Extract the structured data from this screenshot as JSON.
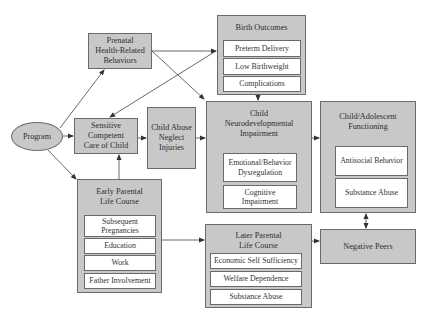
{
  "diagram": {
    "program": "Program",
    "prenatal": {
      "title": "Prenatal Health-Related Behaviors",
      "lines": [
        "Prenatal",
        "Health-Related",
        "Behaviors"
      ]
    },
    "birth_outcomes": {
      "title": "Birth Outcomes",
      "items": [
        "Preterm Delivery",
        "Low Birthweight",
        "Complications"
      ]
    },
    "sensitive_care": {
      "title": "Sensitive Competent Care of Child",
      "lines": [
        "Sensitive",
        "Competent",
        "Care of Child"
      ]
    },
    "child_abuse": {
      "title": "Child Abuse Neglect Injuries",
      "lines": [
        "Child Abuse",
        "Neglect",
        "Injuries"
      ]
    },
    "neuro": {
      "title": "Child Neurodevelopmental Impairment",
      "lines": [
        "Child",
        "Neurodevelopmental",
        "Impairment"
      ],
      "items": [
        "Emotional/Behavior Dysregulation",
        "Cognitive Impairment"
      ]
    },
    "child_adolescent": {
      "title": "Child/Adolescent Functioning",
      "lines": [
        "Child/Adolescent",
        "Functioning"
      ],
      "items": [
        "Antisocial Behavior",
        "Substance Abuse"
      ]
    },
    "early_parental": {
      "title": "Early Parental Life Course",
      "lines": [
        "Early Parental",
        "Life Course"
      ],
      "items": [
        "Subsequent Pregnancies",
        "Education",
        "Work",
        "Father Involvement"
      ]
    },
    "later_parental": {
      "title": "Later Parental Life Course",
      "lines": [
        "Later Parental",
        "Life Course"
      ],
      "items": [
        "Economic Self Sufficiency",
        "Welfare Dependence",
        "Substance Abuse"
      ]
    },
    "negative_peers": "Negative Peers",
    "connections": [
      {
        "from": "Program",
        "to": "Prenatal Health-Related Behaviors"
      },
      {
        "from": "Program",
        "to": "Sensitive Competent Care of Child"
      },
      {
        "from": "Program",
        "to": "Early Parental Life Course"
      },
      {
        "from": "Prenatal Health-Related Behaviors",
        "to": "Birth Outcomes"
      },
      {
        "from": "Prenatal Health-Related Behaviors",
        "to": "Child Neurodevelopmental Impairment"
      },
      {
        "from": "Birth Outcomes",
        "to": "Sensitive Competent Care of Child"
      },
      {
        "from": "Birth Outcomes",
        "to": "Child Neurodevelopmental Impairment"
      },
      {
        "from": "Sensitive Competent Care of Child",
        "to": "Child Abuse Neglect Injuries"
      },
      {
        "from": "Child Abuse Neglect Injuries",
        "to": "Child Neurodevelopmental Impairment"
      },
      {
        "from": "Early Parental Life Course",
        "to": "Sensitive Competent Care of Child"
      },
      {
        "from": "Early Parental Life Course",
        "to": "Later Parental Life Course"
      },
      {
        "from": "Child Neurodevelopmental Impairment",
        "to": "Child/Adolescent Functioning"
      },
      {
        "from": "Later Parental Life Course",
        "to": "Negative Peers"
      },
      {
        "from": "Child/Adolescent Functioning",
        "to": "Negative Peers",
        "bidirectional": true
      }
    ]
  }
}
